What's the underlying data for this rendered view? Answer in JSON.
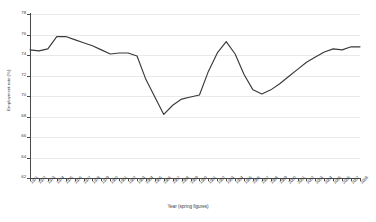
{
  "chart_data": {
    "type": "line",
    "title": "",
    "xlabel": "Year (spring figures)",
    "ylabel": "Employment rate (%)",
    "ylim": [
      62,
      78
    ],
    "ytick_step": 2,
    "yticks": [
      62,
      64,
      66,
      68,
      70,
      72,
      74,
      76,
      78
    ],
    "grid": true,
    "grid_axis": "y",
    "legend": false,
    "legend_position": "none",
    "line_color": "#3a3a3a",
    "categories": [
      "1971",
      "1972",
      "1973",
      "1974",
      "1975",
      "1976",
      "1977",
      "1978",
      "1979",
      "1980",
      "1981",
      "1982",
      "1983",
      "1984",
      "1985",
      "1986",
      "1987",
      "1988",
      "1989",
      "1990",
      "1991",
      "1992",
      "1993",
      "1994",
      "1995",
      "1996",
      "1997",
      "1998",
      "1999",
      "2000",
      "2001",
      "2002",
      "2003",
      "2004",
      "2005",
      "2006",
      "2007",
      "2008"
    ],
    "values": [
      74.5,
      74.4,
      74.6,
      75.8,
      75.8,
      75.5,
      75.2,
      74.9,
      74.5,
      74.1,
      74.2,
      74.2,
      73.9,
      71.6,
      69.9,
      68.2,
      69.1,
      69.7,
      69.9,
      70.1,
      72.4,
      74.2,
      75.3,
      74.1,
      72.1,
      70.6,
      70.2,
      70.6,
      71.2,
      71.9,
      72.6,
      73.3,
      73.8,
      74.3,
      74.6,
      74.5,
      74.8,
      74.8
    ]
  }
}
